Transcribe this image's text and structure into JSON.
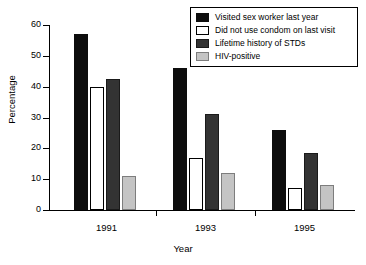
{
  "chart_data": {
    "type": "bar",
    "title": "",
    "subtitle": "",
    "xlabel": "Year",
    "ylabel": "Percentage",
    "categories": [
      "1991",
      "1993",
      "1995"
    ],
    "series": [
      {
        "name": "Visited sex worker last year",
        "color": "#0d0d0d",
        "values": [
          57,
          46,
          26
        ]
      },
      {
        "name": "Did not use condom on last visit",
        "color": "#ffffff",
        "values": [
          40,
          17,
          7
        ]
      },
      {
        "name": "Lifetime history of STDs",
        "color": "#333333",
        "values": [
          42.5,
          31,
          18.5
        ]
      },
      {
        "name": "HIV-positive",
        "color": "#c4c4c4",
        "values": [
          11,
          12,
          8
        ]
      }
    ],
    "ylim": [
      0,
      60
    ],
    "yticks": [
      0,
      10,
      20,
      30,
      40,
      50,
      60
    ],
    "ytick_labels": [
      "0",
      "10",
      "20",
      "30",
      "40",
      "50",
      "60"
    ],
    "grid": false,
    "legend_position": "top-right"
  }
}
